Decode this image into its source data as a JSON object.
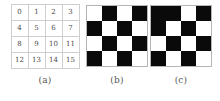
{
  "figure": {
    "background_color": "#ffffff",
    "grid_line_color": "#cfcfcf",
    "black_color": "#0a0a0a",
    "white_color": "#ffffff"
  },
  "panels": [
    {
      "id": "a",
      "caption": "(a)",
      "kind": "index-table",
      "rows": 4,
      "cols": 4,
      "cells": [
        [
          "0",
          "1",
          "2",
          "3"
        ],
        [
          "4",
          "5",
          "6",
          "7"
        ],
        [
          "8",
          "9",
          "10",
          "11"
        ],
        [
          "12",
          "13",
          "14",
          "15"
        ]
      ]
    },
    {
      "id": "b",
      "caption": "(b)",
      "kind": "checkerboard",
      "rows": 4,
      "cols": 4,
      "pattern": [
        [
          "w",
          "b",
          "w",
          "b"
        ],
        [
          "b",
          "w",
          "b",
          "w"
        ],
        [
          "w",
          "b",
          "w",
          "b"
        ],
        [
          "b",
          "w",
          "b",
          "w"
        ]
      ]
    },
    {
      "id": "c",
      "caption": "(c)",
      "kind": "checkerboard",
      "rows": 4,
      "cols": 4,
      "pattern": [
        [
          "b",
          "b",
          "w",
          "b"
        ],
        [
          "b",
          "w",
          "b",
          "w"
        ],
        [
          "w",
          "b",
          "w",
          "b"
        ],
        [
          "b",
          "w",
          "b",
          "w"
        ]
      ]
    }
  ]
}
